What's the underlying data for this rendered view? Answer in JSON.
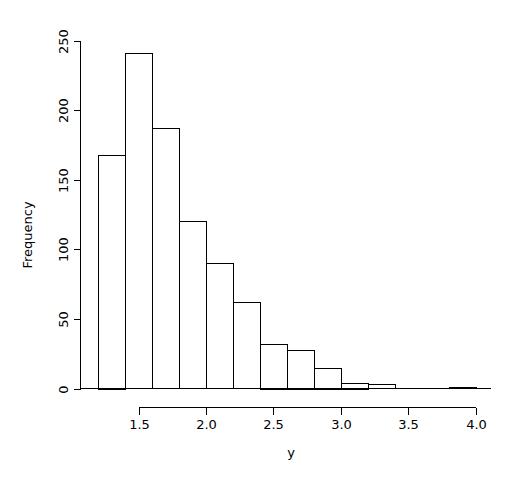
{
  "chart_data": {
    "type": "bar",
    "subtype": "histogram",
    "title": "",
    "xlabel": "y",
    "ylabel": "Frequency",
    "xlim": [
      1.2,
      4.0
    ],
    "ylim": [
      0,
      250
    ],
    "grid": false,
    "legend": null,
    "bin_width": 0.2,
    "bin_edges": [
      1.2,
      1.4,
      1.6,
      1.8,
      2.0,
      2.2,
      2.4,
      2.6,
      2.8,
      3.0,
      3.2,
      3.4,
      3.6,
      3.8,
      4.0
    ],
    "categories": [
      "1.2-1.4",
      "1.4-1.6",
      "1.6-1.8",
      "1.8-2.0",
      "2.0-2.2",
      "2.2-2.4",
      "2.4-2.6",
      "2.6-2.8",
      "2.8-3.0",
      "3.0-3.2",
      "3.2-3.4",
      "3.4-3.6",
      "3.6-3.8",
      "3.8-4.0"
    ],
    "values": [
      168,
      241,
      187,
      120,
      90,
      62,
      32,
      28,
      15,
      4,
      3,
      0,
      0,
      1
    ],
    "x_ticks": [
      1.5,
      2.0,
      2.5,
      3.0,
      3.5,
      4.0
    ],
    "x_tick_labels": [
      "1.5",
      "2.0",
      "2.5",
      "3.0",
      "3.5",
      "4.0"
    ],
    "y_ticks": [
      0,
      50,
      100,
      150,
      200,
      250
    ],
    "y_tick_labels": [
      "0",
      "50",
      "100",
      "150",
      "200",
      "250"
    ],
    "bar_fill_color": "#ffffff",
    "bar_border_color": "#000000",
    "background_color": "#ffffff"
  },
  "axes": {
    "x_label": "y",
    "y_label": "Frequency"
  }
}
